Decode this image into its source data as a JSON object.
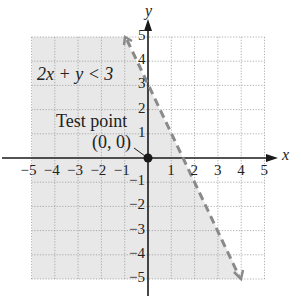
{
  "chart_data": {
    "type": "line",
    "title": "",
    "xlabel": "x",
    "ylabel": "y",
    "xlim": [
      -5,
      5
    ],
    "ylim": [
      -5,
      5
    ],
    "grid": true,
    "x_ticks": [
      "-5",
      "-4",
      "-3",
      "-2",
      "-1",
      "1",
      "2",
      "3",
      "4",
      "5"
    ],
    "y_ticks": [
      "5",
      "4",
      "3",
      "2",
      "1",
      "-1",
      "-2",
      "-3",
      "-4",
      "-5"
    ],
    "series": [
      {
        "name": "2x + y = 3 (boundary, dashed)",
        "style": "dashed",
        "x": [
          -1,
          4
        ],
        "y": [
          5,
          -5
        ]
      }
    ],
    "shaded_region": "2x + y < 3 (left of boundary line)",
    "test_point": {
      "x": 0,
      "y": 0
    },
    "annotations": [
      "2x + y < 3",
      "Test point",
      "(0, 0)"
    ]
  },
  "labels": {
    "inequality": "2x + y < 3",
    "test_point_line1": "Test point",
    "test_point_line2": "(0, 0)",
    "x_axis": "x",
    "y_axis": "y"
  },
  "colors": {
    "shade": "#e6e6e6",
    "grid": "#9a9a9a",
    "axis": "#1a1a1a",
    "boundary": "#888888"
  }
}
